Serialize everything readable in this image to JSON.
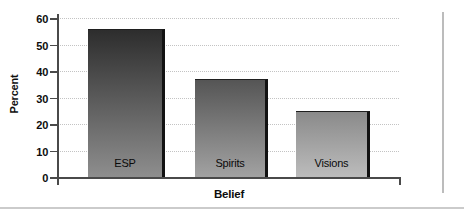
{
  "chart_data": {
    "type": "bar",
    "title": "",
    "xlabel": "Belief",
    "ylabel": "Percent",
    "categories": [
      "ESP",
      "Spirits",
      "Visions"
    ],
    "values": [
      56,
      37,
      25
    ],
    "ylim": [
      0,
      60
    ],
    "ytick_interval": 10,
    "ytick_labels": [
      "0",
      "10",
      "20",
      "30",
      "40",
      "50",
      "60"
    ],
    "grid": "horizontal-dotted",
    "legend_position": "none",
    "bar_label_position": "inside-bottom",
    "axis_color": "#4a4a4a",
    "gridline_color": "#c3c3c3",
    "bar_shadow_color": "#121212",
    "bar_colors": [
      {
        "top": "#2d2d2d",
        "bottom": "#8e8e8e"
      },
      {
        "top": "#555555",
        "bottom": "#a2a2a2"
      },
      {
        "top": "#8a8a8a",
        "bottom": "#bcbcbc"
      }
    ]
  }
}
